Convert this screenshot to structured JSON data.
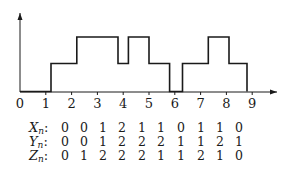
{
  "chart_data": {
    "type": "line",
    "subtype": "step",
    "title": "",
    "xlabel": "",
    "ylabel": "",
    "x_ticks": [
      "0",
      "1",
      "2",
      "3",
      "4",
      "5",
      "6",
      "7",
      "8",
      "9"
    ],
    "xlim": [
      0,
      10
    ],
    "ylim": [
      0,
      2
    ],
    "grid": false,
    "y_tick_labels": false,
    "step_path": [
      {
        "x": 0,
        "y": 0
      },
      {
        "x": 1.2,
        "y": 0
      },
      {
        "x": 1.2,
        "y": 1
      },
      {
        "x": 2.2,
        "y": 1
      },
      {
        "x": 2.2,
        "y": 2
      },
      {
        "x": 3.8,
        "y": 2
      },
      {
        "x": 3.8,
        "y": 1
      },
      {
        "x": 4.2,
        "y": 1
      },
      {
        "x": 4.2,
        "y": 2
      },
      {
        "x": 5.0,
        "y": 2
      },
      {
        "x": 5.0,
        "y": 1
      },
      {
        "x": 5.8,
        "y": 1
      },
      {
        "x": 5.8,
        "y": 0
      },
      {
        "x": 6.3,
        "y": 0
      },
      {
        "x": 6.3,
        "y": 1
      },
      {
        "x": 7.3,
        "y": 1
      },
      {
        "x": 7.3,
        "y": 2
      },
      {
        "x": 8.1,
        "y": 2
      },
      {
        "x": 8.1,
        "y": 1
      },
      {
        "x": 8.8,
        "y": 1
      },
      {
        "x": 8.8,
        "y": 0
      }
    ],
    "table": {
      "rows": [
        {
          "label": "X",
          "subscript": "n",
          "values": [
            0,
            0,
            1,
            2,
            1,
            1,
            0,
            1,
            1,
            0
          ]
        },
        {
          "label": "Y",
          "subscript": "n",
          "values": [
            0,
            0,
            1,
            2,
            2,
            2,
            1,
            1,
            2,
            1
          ]
        },
        {
          "label": "Z",
          "subscript": "n",
          "values": [
            0,
            1,
            2,
            2,
            2,
            1,
            1,
            2,
            1,
            0
          ]
        }
      ]
    }
  },
  "colors": {
    "line": "#1a1a1a",
    "axis": "#1a1a1a",
    "background": "#ffffff"
  }
}
